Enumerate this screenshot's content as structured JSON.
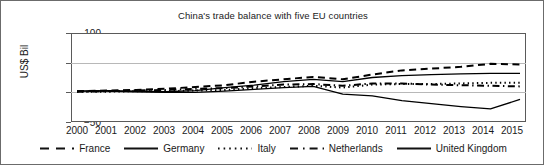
{
  "chart_data": {
    "type": "line",
    "title": "China's trade balance with five EU countries",
    "xlabel": "",
    "ylabel": "US$ Bil",
    "x": [
      2000,
      2001,
      2002,
      2003,
      2004,
      2005,
      2006,
      2007,
      2008,
      2009,
      2010,
      2011,
      2012,
      2013,
      2014,
      2015
    ],
    "xticklabels": [
      "2000",
      "2001",
      "2002",
      "2003",
      "2004",
      "2005",
      "2006",
      "2007",
      "2008",
      "2009",
      "2010",
      "2011",
      "2012",
      "2013",
      "2014",
      "2015"
    ],
    "yticklabels": [
      "100",
      "50",
      "0",
      "−50"
    ],
    "yticks": [
      100,
      50,
      0,
      -50
    ],
    "ylim": [
      -50,
      100
    ],
    "xlim": [
      2000,
      2015
    ],
    "grid": "horizontal",
    "legend_position": "bottom",
    "series": [
      {
        "name": "France",
        "style": "dashed",
        "color": "#000000",
        "values": [
          2,
          3,
          4,
          6,
          9,
          12,
          18,
          22,
          26,
          22,
          30,
          37,
          40,
          43,
          48,
          47
        ]
      },
      {
        "name": "Germany",
        "style": "solid",
        "color": "#000000",
        "values": [
          2,
          3,
          2,
          1,
          3,
          8,
          12,
          18,
          22,
          18,
          25,
          28,
          30,
          31,
          32,
          32
        ]
      },
      {
        "name": "Italy",
        "style": "dotted",
        "color": "#000000",
        "values": [
          1,
          1,
          2,
          2,
          3,
          4,
          7,
          9,
          11,
          8,
          13,
          14,
          14,
          15,
          16,
          16
        ]
      },
      {
        "name": "Netherlands",
        "style": "dashdot",
        "color": "#000000",
        "values": [
          1,
          2,
          3,
          4,
          6,
          7,
          10,
          13,
          14,
          11,
          15,
          15,
          13,
          12,
          11,
          10
        ]
      },
      {
        "name": "United Kingdom",
        "style": "solid",
        "color": "#000000",
        "values": [
          2,
          2,
          1,
          0,
          0,
          2,
          5,
          8,
          10,
          -3,
          -6,
          -14,
          -19,
          -24,
          -28,
          -12
        ]
      }
    ]
  },
  "legend": {
    "items": [
      {
        "label": "France",
        "swatch": "dashed-line-swatch"
      },
      {
        "label": "Germany",
        "swatch": "solid-line-swatch"
      },
      {
        "label": "Italy",
        "swatch": "dotted-line-swatch"
      },
      {
        "label": "Netherlands",
        "swatch": "dashdot-line-swatch"
      },
      {
        "label": "United Kingdom",
        "swatch": "solid-line-swatch"
      }
    ]
  }
}
